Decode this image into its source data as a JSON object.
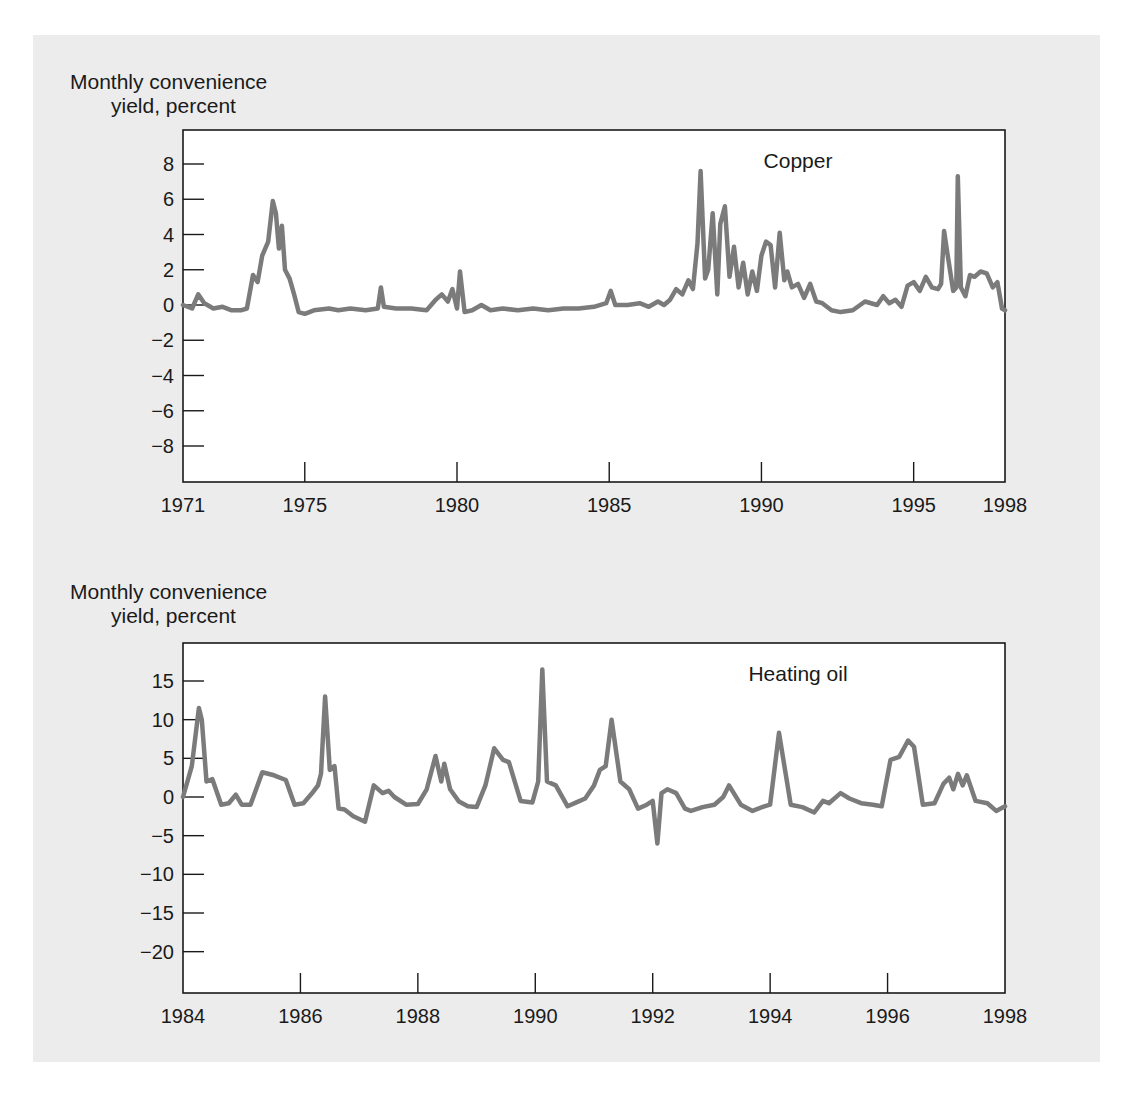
{
  "colors": {
    "panel": "#ececec",
    "plot_bg": "#ffffff",
    "line": "#7b7b7b",
    "axis": "#1a1a1a"
  },
  "chart_data": [
    {
      "type": "line",
      "title": "Copper",
      "ylabel_line1": "Monthly convenience",
      "ylabel_line2": "yield, percent",
      "xlabel": "",
      "xlim": [
        1971,
        1998
      ],
      "ylim": [
        -9.9,
        10
      ],
      "xticks": [
        1971,
        1975,
        1980,
        1985,
        1990,
        1995,
        1998
      ],
      "yticks": [
        8,
        6,
        4,
        2,
        0,
        -2,
        -4,
        -6,
        -8
      ],
      "ytick_labels": [
        "8",
        "6",
        "4",
        "2",
        "0",
        "−2",
        "−4",
        "−6",
        "−8"
      ],
      "grid": false,
      "series": [
        {
          "name": "Copper",
          "x": [
            1971.0,
            1971.3,
            1971.5,
            1971.7,
            1972.0,
            1972.3,
            1972.6,
            1972.9,
            1973.1,
            1973.3,
            1973.45,
            1973.6,
            1973.8,
            1973.95,
            1974.05,
            1974.15,
            1974.25,
            1974.35,
            1974.5,
            1974.65,
            1974.8,
            1975.0,
            1975.3,
            1975.8,
            1976.1,
            1976.5,
            1977.0,
            1977.4,
            1977.5,
            1977.6,
            1978.0,
            1978.5,
            1979.0,
            1979.3,
            1979.5,
            1979.7,
            1979.85,
            1980.0,
            1980.1,
            1980.25,
            1980.5,
            1980.8,
            1981.1,
            1981.5,
            1982.0,
            1982.5,
            1983.0,
            1983.5,
            1984.0,
            1984.5,
            1984.9,
            1985.05,
            1985.2,
            1985.6,
            1986.0,
            1986.3,
            1986.6,
            1986.8,
            1987.0,
            1987.2,
            1987.4,
            1987.6,
            1987.75,
            1987.9,
            1988.0,
            1988.15,
            1988.25,
            1988.4,
            1988.55,
            1988.65,
            1988.8,
            1988.95,
            1989.1,
            1989.25,
            1989.4,
            1989.55,
            1989.7,
            1989.85,
            1990.0,
            1990.15,
            1990.3,
            1990.45,
            1990.6,
            1990.75,
            1990.85,
            1991.0,
            1991.2,
            1991.4,
            1991.6,
            1991.8,
            1992.0,
            1992.3,
            1992.6,
            1993.0,
            1993.4,
            1993.8,
            1994.0,
            1994.2,
            1994.4,
            1994.6,
            1994.8,
            1995.0,
            1995.2,
            1995.4,
            1995.6,
            1995.8,
            1995.9,
            1996.0,
            1996.1,
            1996.3,
            1996.4,
            1996.45,
            1996.55,
            1996.7,
            1996.85,
            1997.0,
            1997.2,
            1997.4,
            1997.6,
            1997.75,
            1997.9,
            1998.0
          ],
          "values": [
            0.0,
            -0.2,
            0.6,
            0.1,
            -0.2,
            -0.1,
            -0.3,
            -0.3,
            -0.2,
            1.7,
            1.3,
            2.8,
            3.6,
            5.9,
            5.2,
            3.2,
            4.5,
            2.0,
            1.5,
            0.6,
            -0.4,
            -0.5,
            -0.3,
            -0.2,
            -0.3,
            -0.2,
            -0.3,
            -0.2,
            1.0,
            -0.1,
            -0.2,
            -0.2,
            -0.3,
            0.3,
            0.6,
            0.2,
            0.9,
            -0.2,
            1.9,
            -0.4,
            -0.3,
            0.0,
            -0.3,
            -0.2,
            -0.3,
            -0.2,
            -0.3,
            -0.2,
            -0.2,
            -0.1,
            0.1,
            0.8,
            0.0,
            0.0,
            0.1,
            -0.1,
            0.2,
            0.0,
            0.3,
            0.9,
            0.6,
            1.4,
            0.9,
            3.5,
            7.6,
            1.5,
            2.0,
            5.2,
            0.6,
            4.6,
            5.6,
            1.6,
            3.3,
            1.0,
            2.4,
            0.6,
            1.9,
            0.8,
            2.8,
            3.6,
            3.4,
            1.0,
            4.1,
            1.4,
            1.9,
            1.0,
            1.2,
            0.4,
            1.2,
            0.2,
            0.1,
            -0.3,
            -0.4,
            -0.3,
            0.2,
            0.0,
            0.5,
            0.1,
            0.3,
            -0.1,
            1.1,
            1.3,
            0.8,
            1.6,
            1.0,
            0.9,
            1.2,
            4.2,
            3.0,
            0.8,
            1.0,
            7.3,
            1.0,
            0.5,
            1.7,
            1.6,
            1.9,
            1.8,
            1.0,
            1.3,
            -0.2,
            -0.3
          ]
        }
      ]
    },
    {
      "type": "line",
      "title": "Heating oil",
      "ylabel_line1": "Monthly convenience",
      "ylabel_line2": "yield, percent",
      "xlabel": "",
      "xlim": [
        1984,
        1998
      ],
      "ylim": [
        -25.5,
        20
      ],
      "xticks": [
        1984,
        1986,
        1988,
        1990,
        1992,
        1994,
        1996,
        1998
      ],
      "yticks": [
        15,
        10,
        5,
        0,
        -5,
        -10,
        -15,
        -20
      ],
      "ytick_labels": [
        "15",
        "10",
        "5",
        "0",
        "−5",
        "−10",
        "−15",
        "−20"
      ],
      "grid": false,
      "series": [
        {
          "name": "Heating oil",
          "x": [
            1984.0,
            1984.15,
            1984.27,
            1984.32,
            1984.4,
            1984.5,
            1984.65,
            1984.78,
            1984.9,
            1985.0,
            1985.15,
            1985.35,
            1985.55,
            1985.75,
            1985.9,
            1986.05,
            1986.2,
            1986.3,
            1986.35,
            1986.42,
            1986.5,
            1986.58,
            1986.65,
            1986.75,
            1986.9,
            1987.1,
            1987.25,
            1987.4,
            1987.5,
            1987.6,
            1987.8,
            1988.0,
            1988.15,
            1988.3,
            1988.4,
            1988.45,
            1988.55,
            1988.7,
            1988.85,
            1989.0,
            1989.15,
            1989.3,
            1989.45,
            1989.55,
            1989.75,
            1989.95,
            1990.05,
            1990.12,
            1990.2,
            1990.35,
            1990.55,
            1990.7,
            1990.85,
            1991.0,
            1991.1,
            1991.2,
            1991.3,
            1991.45,
            1991.6,
            1991.75,
            1991.9,
            1992.0,
            1992.08,
            1992.15,
            1992.25,
            1992.4,
            1992.55,
            1992.65,
            1992.85,
            1993.05,
            1993.2,
            1993.3,
            1993.5,
            1993.7,
            1993.9,
            1994.0,
            1994.15,
            1994.35,
            1994.55,
            1994.75,
            1994.9,
            1995.0,
            1995.2,
            1995.35,
            1995.55,
            1995.75,
            1995.9,
            1996.05,
            1996.2,
            1996.35,
            1996.45,
            1996.6,
            1996.8,
            1996.95,
            1997.05,
            1997.12,
            1997.2,
            1997.28,
            1997.35,
            1997.5,
            1997.7,
            1997.85,
            1998.0
          ],
          "values": [
            0.0,
            4.0,
            11.5,
            10.0,
            2.0,
            2.3,
            -1.0,
            -0.8,
            0.3,
            -1.0,
            -1.0,
            3.2,
            2.8,
            2.2,
            -1.0,
            -0.8,
            0.5,
            1.5,
            3.0,
            13.0,
            3.5,
            4.0,
            -1.5,
            -1.6,
            -2.5,
            -3.2,
            1.5,
            0.5,
            0.8,
            0.0,
            -1.0,
            -0.9,
            1.0,
            5.3,
            2.0,
            4.3,
            1.0,
            -0.6,
            -1.2,
            -1.3,
            1.5,
            6.3,
            4.8,
            4.5,
            -0.5,
            -0.7,
            2.0,
            16.5,
            2.0,
            1.5,
            -1.2,
            -0.7,
            -0.2,
            1.5,
            3.5,
            4.0,
            10.0,
            2.0,
            1.0,
            -1.5,
            -1.0,
            -0.5,
            -6.0,
            0.5,
            1.0,
            0.5,
            -1.5,
            -1.8,
            -1.3,
            -1.0,
            0.0,
            1.5,
            -1.0,
            -1.8,
            -1.2,
            -1.0,
            8.3,
            -1.0,
            -1.3,
            -2.0,
            -0.5,
            -0.8,
            0.5,
            -0.2,
            -0.8,
            -1.0,
            -1.2,
            4.8,
            5.2,
            7.3,
            6.5,
            -1.0,
            -0.8,
            1.7,
            2.5,
            1.0,
            3.0,
            1.5,
            2.8,
            -0.5,
            -0.8,
            -1.8,
            -1.2
          ]
        }
      ]
    }
  ]
}
